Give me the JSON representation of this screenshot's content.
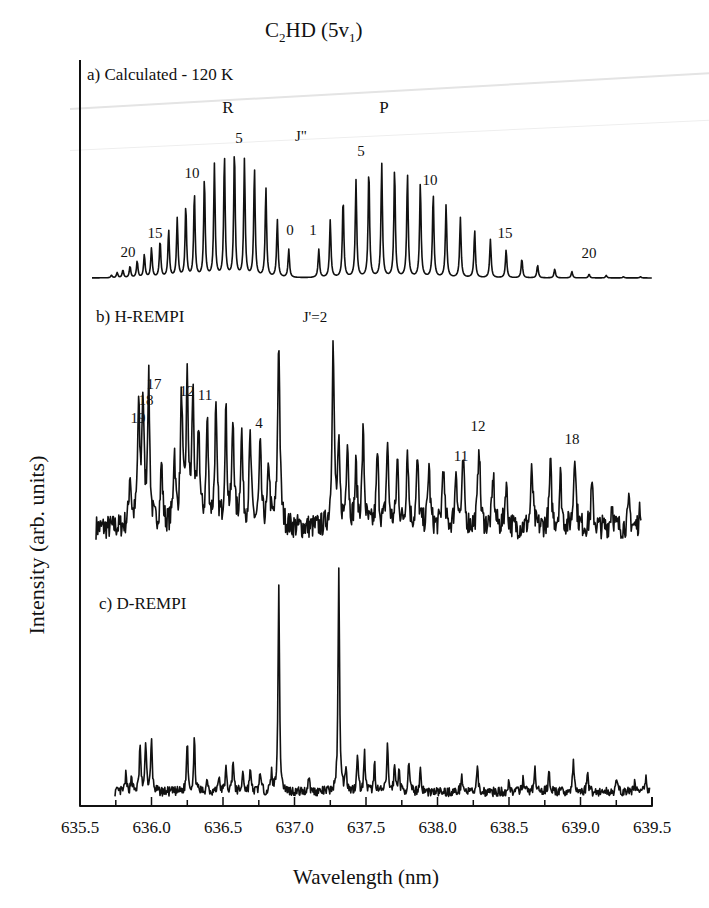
{
  "figure": {
    "title_main": "C",
    "title_sub1": "2",
    "title_mid": "HD  (5v",
    "title_sub2": "1",
    "title_end": ")",
    "ylabel": "Intensity (arb. units)",
    "xlabel": "Wavelength (nm)",
    "line_color": "#111111",
    "background": "#ffffff"
  },
  "chart_data": {
    "type": "line",
    "title": "C2HD (5v1)",
    "xlabel": "Wavelength (nm)",
    "ylabel": "Intensity (arb. units)",
    "xlim": [
      635.5,
      639.5
    ],
    "xticks": [
      "635.5",
      "636.0",
      "636.5",
      "637.0",
      "637.5",
      "638.0",
      "638.5",
      "639.0",
      "639.5"
    ],
    "grid": false,
    "legend": null,
    "panels": [
      {
        "id": "a",
        "label": "a) Calculated - 120 K",
        "branch_labels": [
          {
            "text": "R",
            "x": 636.55
          },
          {
            "text": "P",
            "x": 637.75
          },
          {
            "text": "J\"",
            "x": 637.07
          }
        ],
        "line_annotations": [
          {
            "text": "20",
            "x": 635.8
          },
          {
            "text": "15",
            "x": 635.98
          },
          {
            "text": "10",
            "x": 636.27
          },
          {
            "text": "5",
            "x": 636.62
          },
          {
            "text": "0",
            "x": 636.97
          },
          {
            "text": "1",
            "x": 637.18
          },
          {
            "text": "5",
            "x": 637.51
          },
          {
            "text": "10",
            "x": 637.95
          },
          {
            "text": "15",
            "x": 638.46
          },
          {
            "text": "20",
            "x": 639.08
          }
        ],
        "series": [
          {
            "name": "R branch",
            "x": [
              636.96,
              636.88,
              636.8,
              636.72,
              636.65,
              636.58,
              636.51,
              636.44,
              636.37,
              636.3,
              636.24,
              636.18,
              636.12,
              636.06,
              636.0,
              635.95,
              635.9,
              635.85,
              635.8,
              635.76,
              635.72
            ],
            "J": [
              0,
              1,
              2,
              3,
              4,
              5,
              6,
              7,
              8,
              9,
              10,
              11,
              12,
              13,
              14,
              15,
              16,
              17,
              18,
              19,
              20
            ],
            "values": [
              0.22,
              0.45,
              0.7,
              0.85,
              0.92,
              1.0,
              0.95,
              0.88,
              0.78,
              0.66,
              0.56,
              0.46,
              0.37,
              0.29,
              0.23,
              0.18,
              0.13,
              0.09,
              0.06,
              0.04,
              0.02
            ]
          },
          {
            "name": "P branch",
            "x": [
              637.17,
              637.25,
              637.34,
              637.43,
              637.52,
              637.61,
              637.7,
              637.79,
              637.88,
              637.97,
              638.06,
              638.16,
              638.26,
              638.37,
              638.48,
              638.59,
              638.7,
              638.82,
              638.94,
              639.06,
              639.18,
              639.3,
              639.42
            ],
            "J": [
              1,
              2,
              3,
              4,
              5,
              6,
              7,
              8,
              9,
              10,
              11,
              12,
              13,
              14,
              15,
              16,
              17,
              18,
              19,
              20,
              21,
              22,
              23
            ],
            "values": [
              0.22,
              0.45,
              0.62,
              0.76,
              0.85,
              0.89,
              0.86,
              0.81,
              0.74,
              0.66,
              0.57,
              0.47,
              0.37,
              0.3,
              0.22,
              0.15,
              0.1,
              0.07,
              0.05,
              0.03,
              0.02,
              0.01,
              0.01
            ]
          }
        ]
      },
      {
        "id": "b",
        "label": "b) H-REMPI",
        "line_annotations": [
          {
            "text": "19",
            "x": 635.9
          },
          {
            "text": "18",
            "x": 635.94
          },
          {
            "text": "17",
            "x": 635.99
          },
          {
            "text": "12",
            "x": 636.24
          },
          {
            "text": "11",
            "x": 636.3
          },
          {
            "text": "4",
            "x": 636.75
          },
          {
            "text": "J'=2",
            "x": 637.08
          },
          {
            "text": "11",
            "x": 638.17
          },
          {
            "text": "12",
            "x": 638.29
          },
          {
            "text": "18",
            "x": 638.96
          }
        ],
        "peaks": {
          "x": [
            635.85,
            635.91,
            635.94,
            635.98,
            636.07,
            636.16,
            636.21,
            636.25,
            636.29,
            636.33,
            636.39,
            636.45,
            636.52,
            636.57,
            636.63,
            636.69,
            636.76,
            636.82,
            636.89,
            637.27,
            637.31,
            637.37,
            637.43,
            637.48,
            637.58,
            637.65,
            637.72,
            637.79,
            637.86,
            637.94,
            638.04,
            638.13,
            638.18,
            638.29,
            638.39,
            638.48,
            638.66,
            638.79,
            638.86,
            638.96,
            639.08,
            639.22,
            639.34,
            639.42
          ],
          "values": [
            0.25,
            0.55,
            0.6,
            0.7,
            0.3,
            0.35,
            0.62,
            0.68,
            0.62,
            0.45,
            0.5,
            0.55,
            0.55,
            0.5,
            0.45,
            0.42,
            0.38,
            0.3,
            0.92,
            0.88,
            0.35,
            0.43,
            0.28,
            0.45,
            0.35,
            0.4,
            0.32,
            0.38,
            0.32,
            0.3,
            0.3,
            0.28,
            0.32,
            0.42,
            0.25,
            0.22,
            0.28,
            0.3,
            0.25,
            0.38,
            0.2,
            0.12,
            0.12,
            0.1
          ]
        }
      },
      {
        "id": "c",
        "label": "c) D-REMPI",
        "peaks": {
          "x": [
            635.82,
            635.86,
            635.92,
            635.96,
            636.0,
            636.25,
            636.3,
            636.39,
            636.47,
            636.52,
            636.57,
            636.64,
            636.69,
            636.76,
            636.84,
            636.89,
            637.1,
            637.31,
            637.36,
            637.44,
            637.49,
            637.56,
            637.65,
            637.7,
            637.73,
            637.8,
            637.88,
            638.17,
            638.28,
            638.5,
            638.6,
            638.68,
            638.78,
            638.95,
            639.05,
            639.25,
            639.38,
            639.46
          ],
          "values": [
            0.07,
            0.07,
            0.2,
            0.22,
            0.22,
            0.22,
            0.22,
            0.06,
            0.07,
            0.1,
            0.14,
            0.09,
            0.1,
            0.09,
            0.08,
            0.88,
            0.07,
            0.96,
            0.11,
            0.17,
            0.16,
            0.12,
            0.2,
            0.11,
            0.1,
            0.12,
            0.1,
            0.08,
            0.1,
            0.05,
            0.07,
            0.1,
            0.1,
            0.13,
            0.09,
            0.06,
            0.05,
            0.06
          ]
        }
      }
    ]
  },
  "panels_text": {
    "a": {
      "label": "a) Calculated - 120 K",
      "R": "R",
      "P": "P",
      "J": "J\"",
      "n20a": "20",
      "n15a": "15",
      "n10a": "10",
      "n5a": "5",
      "n0": "0",
      "n1": "1",
      "n5b": "5",
      "n10b": "10",
      "n15b": "15",
      "n20b": "20"
    },
    "b": {
      "label": "b) H-REMPI",
      "n19": "19",
      "n18": "18",
      "n17": "17",
      "n12": "12",
      "n11": "11",
      "n4": "4",
      "j2": "J'=2",
      "n11b": "11",
      "n12b": "12",
      "n18b": "18"
    },
    "c": {
      "label": "c) D-REMPI"
    }
  }
}
